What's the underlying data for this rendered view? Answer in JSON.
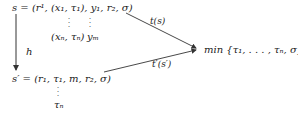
{
  "diagram": {
    "top_row": {
      "lhs": "s",
      "eq": "=",
      "tuple_text": "(r¹, (x₁, τ₁), y₁, r₂, σ)",
      "stacked_below": {
        "pair": "(xₙ, τₙ)",
        "y_end": "yₘ"
      }
    },
    "vertical_arrow_label": "h",
    "bottom_row": {
      "lhs": "s′",
      "eq": "=",
      "tuple_text": "(r₁, τ₁, m, r₂, σ)",
      "stacked_below": "τₙ"
    },
    "arrow_top_label": "t(s)",
    "arrow_bottom_label": "t′(s′)",
    "target": "min {τ₁, . . . , τₙ, σ}",
    "colors": {
      "line": "#333333",
      "text": "#222222",
      "background": "#ffffff"
    }
  }
}
